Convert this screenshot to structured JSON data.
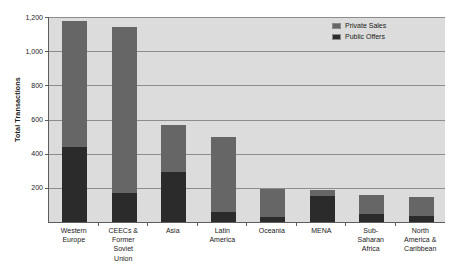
{
  "chart_data": {
    "type": "bar",
    "subtype": "stacked-vertical-bar",
    "title": "",
    "xlabel": "",
    "ylabel": "Total Transactions",
    "ylim": [
      0,
      1200
    ],
    "y_ticks": [
      200,
      400,
      600,
      800,
      1000,
      1200
    ],
    "y_tick_labels": [
      "200",
      "400",
      "600",
      "800",
      "1,000",
      "1,200"
    ],
    "grid": "horizontal",
    "legend_position": "top-right",
    "plot_background": "#dcdcdc",
    "categories": [
      "Western Europe",
      "CEECs & Former Soviet Union",
      "Asia",
      "Latin America",
      "Oceania",
      "MENA",
      "Sub-Saharan Africa",
      "North America & Caribbean"
    ],
    "category_label_lines": [
      [
        "Western",
        "Europe"
      ],
      [
        "CEECs &",
        "Former",
        "Soviet",
        "Union"
      ],
      [
        "Asia"
      ],
      [
        "Latin",
        "America"
      ],
      [
        "Oceania"
      ],
      [
        "MENA"
      ],
      [
        "Sub-",
        "Saharan",
        "Africa"
      ],
      [
        "North",
        "America &",
        "Caribbean"
      ]
    ],
    "series": [
      {
        "name": "Public Offers",
        "color": "#2b2b2b",
        "values": [
          440,
          170,
          295,
          60,
          30,
          150,
          45,
          35
        ]
      },
      {
        "name": "Private Sales",
        "color": "#666666",
        "values": [
          735,
          970,
          275,
          435,
          165,
          35,
          115,
          110
        ]
      }
    ],
    "totals": [
      1175,
      1140,
      570,
      495,
      195,
      185,
      160,
      145
    ]
  },
  "legend": {
    "items": [
      {
        "label": "Private Sales",
        "color": "#666666"
      },
      {
        "label": "Public Offers",
        "color": "#2b2b2b"
      }
    ]
  }
}
